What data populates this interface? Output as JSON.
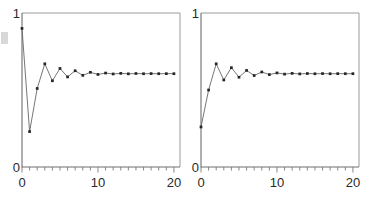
{
  "figure": {
    "name": "two-panel-convergence-figure",
    "background": "#ffffff",
    "width": 378,
    "height": 197,
    "line_color": "#5d5d5d",
    "marker_color": "#262626",
    "frame_color": "#9a9a9a",
    "axis_color": "#6e6e6e",
    "text_color": "#2a2a2a"
  },
  "chart_data": [
    {
      "type": "line",
      "id": "left-panel",
      "title": "",
      "xlabel": "",
      "ylabel": "",
      "xlim": [
        0,
        20.8
      ],
      "ylim": [
        0,
        1
      ],
      "grid": false,
      "legend": null,
      "markers": true,
      "marker_shape": "square",
      "x_ticks_major": [
        0,
        10,
        20
      ],
      "x_ticklabels": [
        "0",
        "10",
        "20"
      ],
      "x_ticks_minor": [
        0,
        1,
        2,
        3,
        4,
        5,
        6,
        7,
        8,
        9,
        10,
        11,
        12,
        13,
        14,
        15,
        16,
        17,
        18,
        19,
        20
      ],
      "y_ticks_major": [
        0,
        1
      ],
      "y_ticklabels": [
        "0",
        "1"
      ],
      "x": [
        0,
        1,
        2,
        3,
        4,
        5,
        6,
        7,
        8,
        9,
        10,
        11,
        12,
        13,
        14,
        15,
        16,
        17,
        18,
        19,
        20
      ],
      "values": [
        0.9,
        0.23,
        0.51,
        0.67,
        0.56,
        0.64,
        0.585,
        0.625,
        0.595,
        0.615,
        0.601,
        0.61,
        0.604,
        0.608,
        0.605,
        0.607,
        0.6055,
        0.6065,
        0.6058,
        0.6062,
        0.606
      ]
    },
    {
      "type": "line",
      "id": "right-panel",
      "title": "",
      "xlabel": "",
      "ylabel": "",
      "xlim": [
        0,
        20.8
      ],
      "ylim": [
        0,
        1
      ],
      "grid": false,
      "legend": null,
      "markers": true,
      "marker_shape": "square",
      "x_ticks_major": [
        0,
        10,
        20
      ],
      "x_ticklabels": [
        "0",
        "10",
        "20"
      ],
      "x_ticks_minor": [
        0,
        1,
        2,
        3,
        4,
        5,
        6,
        7,
        8,
        9,
        10,
        11,
        12,
        13,
        14,
        15,
        16,
        17,
        18,
        19,
        20
      ],
      "y_ticks_major": [
        0,
        1
      ],
      "y_ticklabels": [
        "0",
        "1"
      ],
      "x": [
        0,
        1,
        2,
        3,
        4,
        5,
        6,
        7,
        8,
        9,
        10,
        11,
        12,
        13,
        14,
        15,
        16,
        17,
        18,
        19,
        20
      ],
      "values": [
        0.26,
        0.5,
        0.67,
        0.565,
        0.645,
        0.583,
        0.627,
        0.594,
        0.617,
        0.6,
        0.611,
        0.603,
        0.608,
        0.6045,
        0.607,
        0.6053,
        0.6065,
        0.6056,
        0.6062,
        0.6058,
        0.606
      ]
    }
  ]
}
